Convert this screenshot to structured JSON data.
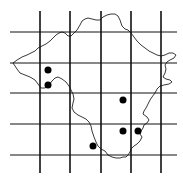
{
  "map": {
    "type": "distribution-grid-map",
    "colors": {
      "background": "#ffffff",
      "grid": "#111111",
      "outline": "#222222",
      "dot": "#000000"
    },
    "grid": {
      "vertical_x": [
        40,
        70,
        101,
        131,
        161
      ],
      "vertical_y_range": [
        11,
        173
      ],
      "horizontal_y": [
        32,
        63,
        93,
        124,
        155
      ],
      "horizontal_x_range": [
        10,
        177
      ]
    },
    "occurrence_points": [
      {
        "x": 48,
        "y": 70
      },
      {
        "x": 48,
        "y": 85
      },
      {
        "x": 123,
        "y": 100
      },
      {
        "x": 123,
        "y": 131
      },
      {
        "x": 138,
        "y": 131
      },
      {
        "x": 93,
        "y": 146
      }
    ],
    "region_outline": "M13,63 L17,60 L22,57 L27,55 L31,53 L35,51 L38,48 L42,46 L46,44 L50,41 L53,38 L56,35 L59,33 L62,32 L65,33 L68,36 L71,36 L74,33 L77,30 L80,25 L82,21 L85,19 L88,18 L92,19 L96,20 L100,20 L103,17 L107,15 L111,14 L115,14 L118,16 L120,20 L122,26 L125,29 L128,30 L131,33 L134,37 L137,41 L141,45 L145,48 L149,51 L153,53 L157,55 L161,56 L165,55 L169,53 L173,53 L176,55 L174,58 L170,60 L167,62 L165,65 L166,69 L165,73 L163,77 L166,79 L170,80 L172,82 L169,84 L164,85 L160,86 L157,89 L155,93 L152,97 L150,100 L148,104 L146,108 L144,111 L143,114 L147,117 L149,120 L147,123 L144,125 L143,128 L141,131 L140,134 L142,137 L140,141 L137,144 L134,146 L131,149 L130,152 L128,155 L126,157 L123,157 L120,158 L116,158 L112,157 L108,155 L105,151 L101,149 L98,146 L96,142 L94,137 L92,131 L91,126 L89,122 L86,119 L82,117 L78,115 L74,112 L72,108 L73,103 L74,99 L73,94 L71,90 L69,86 L66,82 L62,79 L58,77 L55,78 L52,81 L49,85 L45,88 L41,88 L38,84 L35,80 L30,77 L25,75 L20,73 L17,69 L15,66 Z"
  }
}
